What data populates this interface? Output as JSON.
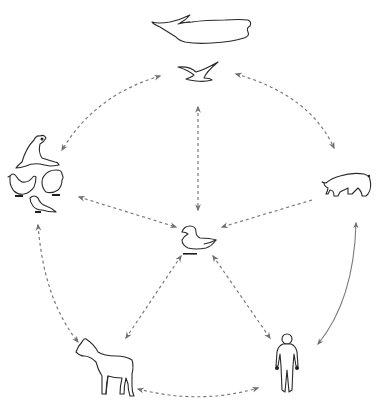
{
  "diagram": {
    "type": "host-transmission-network",
    "nodes": [
      {
        "id": "whale",
        "label": "whale",
        "icon": "whale-icon"
      },
      {
        "id": "seabird",
        "label": "seabird",
        "icon": "seabird-icon"
      },
      {
        "id": "poultry_group",
        "label": "seal, chicken, turkey, songbird",
        "icon": "bird-group-icon"
      },
      {
        "id": "pig",
        "label": "pig",
        "icon": "pig-icon"
      },
      {
        "id": "duck",
        "label": "duck",
        "icon": "duck-icon"
      },
      {
        "id": "horse",
        "label": "horse",
        "icon": "horse-icon"
      },
      {
        "id": "human",
        "label": "human",
        "icon": "human-icon"
      }
    ],
    "edges": [
      {
        "from": "seabird",
        "to": "poultry_group",
        "style": "dashed",
        "direction": "bidirectional"
      },
      {
        "from": "seabird",
        "to": "pig",
        "style": "dashed",
        "direction": "bidirectional"
      },
      {
        "from": "seabird",
        "to": "duck",
        "style": "dashed",
        "direction": "bidirectional"
      },
      {
        "from": "poultry_group",
        "to": "duck",
        "style": "dashed",
        "direction": "bidirectional"
      },
      {
        "from": "pig",
        "to": "duck",
        "style": "dashed",
        "direction": "to-duck"
      },
      {
        "from": "poultry_group",
        "to": "horse",
        "style": "dashed",
        "direction": "bidirectional"
      },
      {
        "from": "duck",
        "to": "horse",
        "style": "dashed",
        "direction": "bidirectional"
      },
      {
        "from": "duck",
        "to": "human",
        "style": "dashed",
        "direction": "bidirectional"
      },
      {
        "from": "horse",
        "to": "human",
        "style": "dashed",
        "direction": "bidirectional"
      },
      {
        "from": "pig",
        "to": "human",
        "style": "solid",
        "direction": "bidirectional"
      }
    ],
    "colors": {
      "arrow": "#7a7a7a",
      "outline": "#2a2a2a",
      "background": "#ffffff"
    }
  }
}
